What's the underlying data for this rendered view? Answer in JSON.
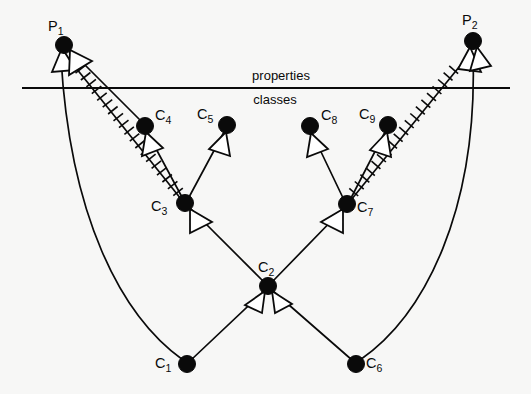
{
  "figure": {
    "background_color": "#f7f7f6",
    "stroke_color": "#0a0a0a",
    "width": 531,
    "height": 394
  },
  "bands": {
    "divider": {
      "label_above": "properties",
      "label_below": "classes",
      "y": 88,
      "x_start": 22,
      "x_end": 510
    }
  },
  "nodes": [
    {
      "id": "P1",
      "base": "P",
      "sub": "1",
      "x": 64,
      "y": 45,
      "label_dx": -16,
      "label_dy": -14,
      "region": "properties"
    },
    {
      "id": "P2",
      "base": "P",
      "sub": "2",
      "x": 473,
      "y": 41,
      "label_dx": -4,
      "label_dy": -16,
      "region": "properties"
    },
    {
      "id": "C1",
      "base": "C",
      "sub": "1",
      "x": 187,
      "y": 364,
      "label_dx": -32,
      "label_dy": -1,
      "region": "classes"
    },
    {
      "id": "C2",
      "base": "C",
      "sub": "2",
      "x": 268,
      "y": 286,
      "label_dx": -4,
      "label_dy": -17,
      "region": "classes"
    },
    {
      "id": "C3",
      "base": "C",
      "sub": "3",
      "x": 185,
      "y": 203,
      "label_dx": -34,
      "label_dy": 5,
      "region": "classes"
    },
    {
      "id": "C4",
      "base": "C",
      "sub": "4",
      "x": 145,
      "y": 126,
      "label_dx": 9,
      "label_dy": -8,
      "region": "classes"
    },
    {
      "id": "C5",
      "base": "C",
      "sub": "5",
      "x": 227,
      "y": 125,
      "label_dx": -31,
      "label_dy": -9,
      "region": "classes"
    },
    {
      "id": "C6",
      "base": "C",
      "sub": "6",
      "x": 356,
      "y": 364,
      "label_dx": 9,
      "label_dy": -1,
      "region": "classes"
    },
    {
      "id": "C7",
      "base": "C",
      "sub": "7",
      "x": 347,
      "y": 204,
      "label_dx": 9,
      "label_dy": 5,
      "region": "classes"
    },
    {
      "id": "C8",
      "base": "C",
      "sub": "8",
      "x": 310,
      "y": 126,
      "label_dx": 10,
      "label_dy": -8,
      "region": "classes"
    },
    {
      "id": "C9",
      "base": "C",
      "sub": "9",
      "x": 388,
      "y": 125,
      "label_dx": -30,
      "label_dy": -9,
      "region": "classes"
    }
  ],
  "edges": [
    {
      "from": "C3",
      "to": "C4",
      "style": "solid",
      "arrow": "open-triangle",
      "kind": "subsumption"
    },
    {
      "from": "C3",
      "to": "C5",
      "style": "solid",
      "arrow": "open-triangle",
      "kind": "subsumption"
    },
    {
      "from": "C7",
      "to": "C8",
      "style": "solid",
      "arrow": "open-triangle",
      "kind": "subsumption"
    },
    {
      "from": "C7",
      "to": "C9",
      "style": "solid",
      "arrow": "open-triangle",
      "kind": "subsumption"
    },
    {
      "from": "C2",
      "to": "C3",
      "style": "solid",
      "arrow": "open-triangle",
      "kind": "subsumption"
    },
    {
      "from": "C2",
      "to": "C7",
      "style": "solid",
      "arrow": "open-triangle",
      "kind": "subsumption"
    },
    {
      "from": "C1",
      "to": "C2",
      "style": "solid",
      "arrow": "open-triangle",
      "kind": "subsumption"
    },
    {
      "from": "C6",
      "to": "C2",
      "style": "solid",
      "arrow": "open-triangle",
      "kind": "subsumption"
    },
    {
      "from": "C3",
      "to": "P1",
      "style": "hatched",
      "arrow": "open-triangle",
      "kind": "domain-link"
    },
    {
      "from": "C4",
      "to": "P1",
      "style": "solid",
      "arrow": "open-triangle",
      "kind": "domain-link"
    },
    {
      "from": "C1",
      "to": "P1",
      "style": "curved",
      "arrow": "open-triangle",
      "kind": "domain-link"
    },
    {
      "from": "C7",
      "to": "P2",
      "style": "hatched",
      "arrow": "open-triangle",
      "kind": "domain-link"
    },
    {
      "from": "C6",
      "to": "P2",
      "style": "curved",
      "arrow": "open-triangle",
      "kind": "domain-link"
    }
  ],
  "legend": {
    "solid_edge": "subsumption / specialization arrow",
    "hatched_edge": "cross-hatched property link",
    "arrowhead": "hollow open triangle"
  }
}
